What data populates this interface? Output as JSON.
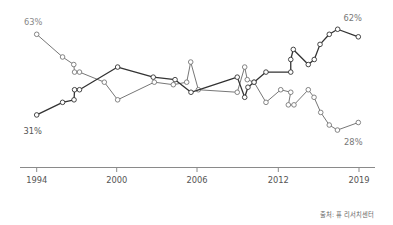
{
  "chart_data": {
    "type": "line",
    "title": "",
    "xlabel": "",
    "ylabel": "",
    "units": "%",
    "grid": false,
    "legend": "none",
    "x_ticks": [
      "1994",
      "2000",
      "2006",
      "2012",
      "2019"
    ],
    "x_tick_values": [
      1994,
      2000,
      2006,
      2012,
      2019
    ],
    "series": [
      {
        "id": "falling",
        "color": "#777777",
        "points": [
          [
            1994,
            63
          ],
          [
            1995.94,
            54
          ],
          [
            1996.78,
            51
          ],
          [
            1996.84,
            48
          ],
          [
            1997.21,
            48
          ],
          [
            1999.07,
            44
          ],
          [
            2000.07,
            37
          ],
          [
            2002.81,
            44
          ],
          [
            2004.23,
            43
          ],
          [
            2005.23,
            44
          ],
          [
            2005.53,
            52
          ],
          [
            2006.1,
            41
          ],
          [
            2008.97,
            40
          ],
          [
            2009.52,
            50
          ],
          [
            2009.71,
            45
          ],
          [
            2010.21,
            44
          ],
          [
            2011.09,
            36
          ],
          [
            2012.21,
            41
          ],
          [
            2013.08,
            40
          ],
          [
            2012.87,
            35
          ],
          [
            2013.36,
            35
          ],
          [
            2014.6,
            41
          ],
          [
            2015.1,
            38
          ],
          [
            2015.68,
            32
          ],
          [
            2016.42,
            27
          ],
          [
            2017.13,
            25
          ],
          [
            2018.94,
            28
          ]
        ]
      },
      {
        "id": "rising",
        "color": "#333333",
        "points": [
          [
            1994,
            31
          ],
          [
            1995.94,
            36
          ],
          [
            1996.8,
            37
          ],
          [
            1996.84,
            41
          ],
          [
            1997.21,
            41
          ],
          [
            2000.07,
            50
          ],
          [
            2002.73,
            46
          ],
          [
            2004.36,
            45
          ],
          [
            2005.55,
            40
          ],
          [
            2008.97,
            46
          ],
          [
            2009.52,
            38
          ],
          [
            2009.76,
            42
          ],
          [
            2010.21,
            44
          ],
          [
            2011.09,
            48
          ],
          [
            2013.08,
            48
          ],
          [
            2013.08,
            53
          ],
          [
            2013.3,
            57
          ],
          [
            2014.6,
            51
          ],
          [
            2015.12,
            53
          ],
          [
            2015.62,
            59
          ],
          [
            2016.42,
            63
          ],
          [
            2017.15,
            65
          ],
          [
            2018.94,
            62
          ]
        ]
      }
    ],
    "annotations": [
      {
        "series": "falling",
        "at": "start",
        "position": "above",
        "text": "63%",
        "color": "#888888"
      },
      {
        "series": "rising",
        "at": "start",
        "position": "below",
        "text": "31%",
        "color": "#555555"
      },
      {
        "series": "rising",
        "at": "end",
        "position": "above",
        "text": "62%",
        "color": "#777777"
      },
      {
        "series": "falling",
        "at": "end",
        "position": "below",
        "text": "28%",
        "color": "#777777"
      }
    ]
  },
  "source": "출처: 퓨 리서치센터"
}
